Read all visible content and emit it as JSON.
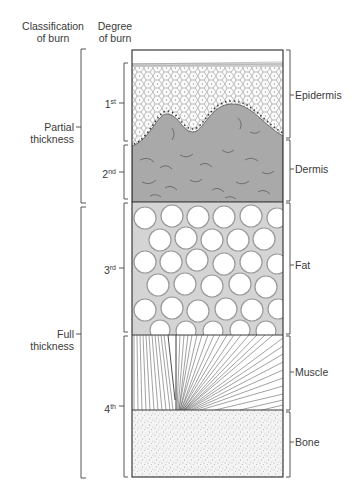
{
  "headers": {
    "classification": [
      "Classification",
      "of burn"
    ],
    "degree": [
      "Degree",
      "of burn"
    ]
  },
  "classification": [
    {
      "lines": [
        "Partial",
        "thickness"
      ],
      "range": [
        49,
        205
      ]
    },
    {
      "lines": [
        "Full",
        "thickness"
      ],
      "range": [
        205,
        478
      ]
    }
  ],
  "degrees": [
    {
      "num": "1",
      "suffix": "st",
      "range": [
        63,
        143
      ]
    },
    {
      "num": "2",
      "suffix": "nd",
      "range": [
        143,
        201
      ]
    },
    {
      "num": "3",
      "suffix": "rd",
      "range": [
        201,
        334
      ]
    },
    {
      "num": "4",
      "suffix": "th",
      "range": [
        334,
        478
      ]
    }
  ],
  "layers": [
    {
      "label": "Epidermis",
      "range": [
        50,
        138
      ]
    },
    {
      "label": "Dermis",
      "range": [
        140,
        201
      ]
    },
    {
      "label": "Fat",
      "range": [
        203,
        334
      ]
    },
    {
      "label": "Muscle",
      "range": [
        336,
        410
      ]
    },
    {
      "label": "Bone",
      "range": [
        412,
        477
      ]
    }
  ],
  "colors": {
    "outline": "#3a3a3a",
    "dermis": "#a9a9a9",
    "fat_bg": "#d4d4d4",
    "muscle_lines": "#555555",
    "bone_bg": "#f2f2f2"
  }
}
